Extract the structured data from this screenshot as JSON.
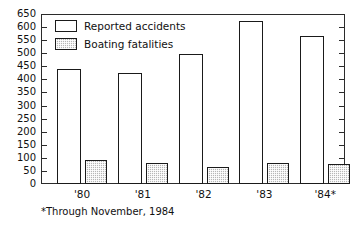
{
  "chart_data": {
    "type": "bar",
    "title": "",
    "subtitle": "",
    "xlabel": "",
    "ylabel": "",
    "categories": [
      "'80",
      "'81",
      "'82",
      "'83",
      "'84*"
    ],
    "series": [
      {
        "name": "Reported accidents",
        "values": [
          440,
          425,
          497,
          622,
          567
        ],
        "style": "white-outline"
      },
      {
        "name": "Boating fatalities",
        "values": [
          90,
          82,
          65,
          82,
          78
        ],
        "style": "gray-stipple"
      }
    ],
    "ylim": [
      0,
      650
    ],
    "ytick_labels": [
      "650",
      "600",
      "550",
      "500",
      "450",
      "400",
      "350",
      "300",
      "250",
      "200",
      "150",
      "100",
      "50",
      "0"
    ],
    "ytick_values": [
      650,
      600,
      550,
      500,
      450,
      400,
      350,
      300,
      250,
      200,
      150,
      100,
      50,
      0
    ],
    "ytick_step": 50,
    "grid": false,
    "legend_position": "top-left",
    "annotations": [
      "*Through November, 1984"
    ],
    "colors": {
      "accidents_fill": "#ffffff",
      "fatalities_fill": "#b6b6b6",
      "outline": "#1a1a1a",
      "axis": "#2b2b2b",
      "text": "#111111",
      "background": "#ffffff"
    }
  },
  "legend": {
    "items": [
      {
        "label": "Reported accidents"
      },
      {
        "label": "Boating fatalities"
      }
    ]
  },
  "footnote": {
    "text": "*Through November, 1984"
  }
}
